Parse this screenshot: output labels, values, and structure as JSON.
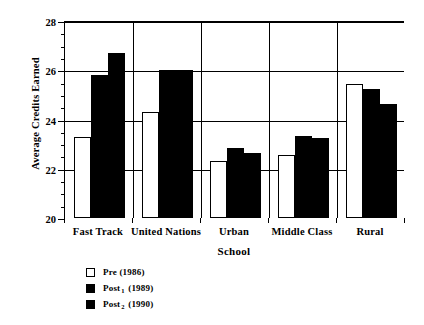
{
  "chart_data": {
    "type": "bar",
    "title": "",
    "xlabel": "School",
    "ylabel": "Average Credits Earned",
    "categories": [
      "Fast Track",
      "United Nations",
      "Urban",
      "Middle Class",
      "Rural"
    ],
    "series": [
      {
        "name": "Pre (1986)",
        "name_base": "Pre",
        "name_sub": "",
        "name_year": "(1986)",
        "color": "#ffffff",
        "values": [
          23.3,
          24.3,
          22.3,
          22.55,
          25.45
        ]
      },
      {
        "name": "Post1 (1989)",
        "name_base": "Post",
        "name_sub": "1",
        "name_year": "(1989)",
        "color": "#000000",
        "values": [
          25.8,
          26.0,
          22.85,
          23.35,
          25.25
        ]
      },
      {
        "name": "Post2 (1990)",
        "name_base": "Post",
        "name_sub": "2",
        "name_year": "(1990)",
        "color": "#000000",
        "values": [
          26.7,
          26.0,
          22.65,
          23.25,
          24.65
        ]
      }
    ],
    "ylim": [
      20,
      28
    ],
    "ytick_major": [
      20,
      22,
      24,
      26,
      28
    ],
    "ytick_major_labels": [
      "20",
      "22",
      "24",
      "26",
      "28"
    ],
    "ytick_minor_step": 0.5,
    "grid": "horizontal-major-and-group-separators",
    "legend_position": "below-left"
  },
  "axes": {
    "y_title": "Average Credits Earned",
    "x_title": "School"
  },
  "legend": {
    "entries": [
      {
        "label_base": "Pre",
        "label_sub": "",
        "label_year": "(1986)",
        "swatch": "white"
      },
      {
        "label_base": "Post",
        "label_sub": "1",
        "label_year": "(1989)",
        "swatch": "black"
      },
      {
        "label_base": "Post",
        "label_sub": "2",
        "label_year": "(1990)",
        "swatch": "black"
      }
    ]
  }
}
